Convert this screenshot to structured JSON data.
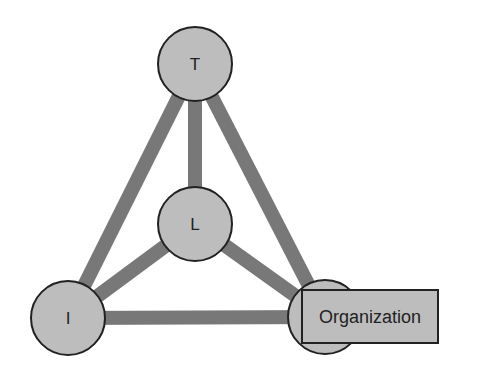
{
  "diagram": {
    "title": "",
    "colors": {
      "background": "#ffffff",
      "edge": "#787878",
      "node_fill": "#bdbdbd",
      "node_stroke": "#222222",
      "text": "#222222"
    },
    "nodes": [
      {
        "id": "T",
        "label": "T",
        "cx": 195,
        "cy": 64,
        "r": 37
      },
      {
        "id": "L",
        "label": "L",
        "cx": 195,
        "cy": 224,
        "r": 37
      },
      {
        "id": "I",
        "label": "I",
        "cx": 68,
        "cy": 318,
        "r": 37
      },
      {
        "id": "O",
        "label": "",
        "cx": 325,
        "cy": 317,
        "r": 37
      }
    ],
    "edges": [
      {
        "from": "T",
        "to": "L"
      },
      {
        "from": "T",
        "to": "I"
      },
      {
        "from": "T",
        "to": "O"
      },
      {
        "from": "L",
        "to": "I"
      },
      {
        "from": "L",
        "to": "O"
      },
      {
        "from": "I",
        "to": "O"
      }
    ],
    "label_box": {
      "node": "O",
      "text": "Organization",
      "x": 302,
      "y": 290,
      "width": 136,
      "height": 53
    }
  }
}
